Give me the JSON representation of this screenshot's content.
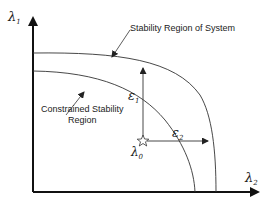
{
  "diagram": {
    "axes": {
      "y_label": "λ",
      "y_sub": "1",
      "x_label": "λ",
      "x_sub": "2"
    },
    "curves": [
      {
        "name": "outer",
        "label": "Stability Region of System"
      },
      {
        "name": "inner",
        "label_line1": "Constrained Stability",
        "label_line2": "Region"
      }
    ],
    "point": {
      "label": "λ",
      "sub": "0"
    },
    "arrows": [
      {
        "label": "ε",
        "sub": "1"
      },
      {
        "label": "ε",
        "sub": "2"
      }
    ]
  }
}
